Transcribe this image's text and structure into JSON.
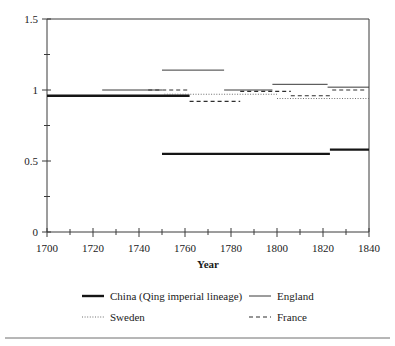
{
  "chart_data": {
    "type": "line",
    "title": "",
    "xlabel": "Year",
    "ylabel": "",
    "xlim": [
      1700,
      1840
    ],
    "ylim": [
      0,
      1.5
    ],
    "grid": false,
    "legend_position": "bottom",
    "x_ticks_major": [
      1700,
      1720,
      1740,
      1760,
      1780,
      1800,
      1820,
      1840
    ],
    "x_ticks_minor": [
      1710,
      1730,
      1750,
      1770,
      1790,
      1810,
      1830
    ],
    "y_ticks_major": [
      0,
      0.5,
      1,
      1.5
    ],
    "y_ticks_minor": [
      0.25,
      0.75,
      1.25
    ],
    "x_tick_labels": [
      "1700",
      "1720",
      "1740",
      "1760",
      "1780",
      "1800",
      "1820",
      "1840"
    ],
    "y_tick_labels": [
      "0",
      "0.5",
      "1",
      "1.5"
    ],
    "series": [
      {
        "name": "China (Qing imperial lineage)",
        "style": "solid-thick",
        "color": "#151515",
        "segments": [
          {
            "x": [
              1700,
              1762
            ],
            "y": [
              0.96,
              0.96
            ]
          },
          {
            "x": [
              1750,
              1823
            ],
            "y": [
              0.55,
              0.55
            ]
          },
          {
            "x": [
              1823,
              1840
            ],
            "y": [
              0.58,
              0.58
            ]
          }
        ]
      },
      {
        "name": "England",
        "style": "solid-thin",
        "color": "#3a3a3a",
        "segments": [
          {
            "x": [
              1724,
              1750
            ],
            "y": [
              1.0,
              1.0
            ]
          },
          {
            "x": [
              1750,
              1777
            ],
            "y": [
              1.14,
              1.14
            ]
          },
          {
            "x": [
              1777,
              1798
            ],
            "y": [
              1.0,
              1.0
            ]
          },
          {
            "x": [
              1798,
              1822
            ],
            "y": [
              1.04,
              1.04
            ]
          },
          {
            "x": [
              1822,
              1840
            ],
            "y": [
              1.02,
              1.02
            ]
          }
        ]
      },
      {
        "name": "Sweden",
        "style": "dotted",
        "color": "#6e6e6e",
        "segments": [
          {
            "x": [
              1751,
              1800
            ],
            "y": [
              0.97,
              0.97
            ]
          },
          {
            "x": [
              1800,
              1840
            ],
            "y": [
              0.94,
              0.94
            ]
          }
        ]
      },
      {
        "name": "France",
        "style": "dashed",
        "color": "#2e2e2e",
        "segments": [
          {
            "x": [
              1744,
              1762
            ],
            "y": [
              1.0,
              1.0
            ]
          },
          {
            "x": [
              1762,
              1784
            ],
            "y": [
              0.92,
              0.92
            ]
          },
          {
            "x": [
              1784,
              1806
            ],
            "y": [
              0.99,
              0.99
            ]
          },
          {
            "x": [
              1806,
              1824
            ],
            "y": [
              0.96,
              0.96
            ]
          },
          {
            "x": [
              1824,
              1838
            ],
            "y": [
              1.0,
              1.0
            ]
          }
        ]
      }
    ]
  },
  "legend": {
    "items": [
      {
        "label": "China (Qing imperial lineage)",
        "style": "solid-thick"
      },
      {
        "label": "England",
        "style": "solid-thin"
      },
      {
        "label": "Sweden",
        "style": "dotted"
      },
      {
        "label": "France",
        "style": "dashed"
      }
    ]
  },
  "axis": {
    "x_title": "Year"
  }
}
